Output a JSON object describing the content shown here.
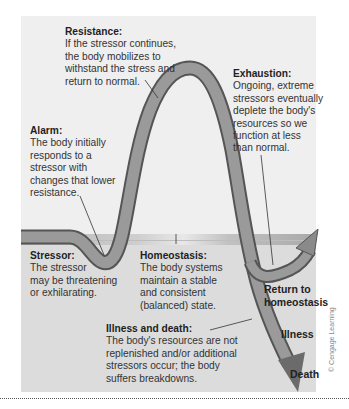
{
  "diagram": {
    "type": "stress-response-curve",
    "colors": {
      "panel_upper": "#efefef",
      "panel_lower": "#dcdcdc",
      "band": "#b5b5b5",
      "curve_fill": "#8f8f8f",
      "curve_edge": "#5a5a5a",
      "text": "#333333"
    },
    "labels": {
      "resistance": {
        "heading": "Resistance:",
        "lines": [
          "If the stressor continues,",
          "the body mobilizes to",
          "withstand the stress and",
          "return to normal."
        ]
      },
      "exhaustion": {
        "heading": "Exhaustion:",
        "lines": [
          "Ongoing, extreme",
          "stressors eventually",
          "deplete the body's",
          "resources so we",
          "function at less",
          "than normal."
        ]
      },
      "alarm": {
        "heading": "Alarm:",
        "lines": [
          "The body initially",
          "responds to a",
          "stressor with",
          "changes that lower",
          "resistance."
        ]
      },
      "stressor": {
        "heading": "Stressor:",
        "lines": [
          "The stressor",
          "may be threatening",
          "or exhilarating."
        ]
      },
      "homeostasis": {
        "heading": "Homeostasis:",
        "lines": [
          "The body systems",
          "maintain a stable",
          "and consistent",
          "(balanced) state."
        ]
      },
      "illness_death": {
        "heading": "Illness and death:",
        "lines": [
          "The body's resources are not",
          "replenished and/or additional",
          "stressors occur; the body",
          "suffers breakdowns."
        ]
      }
    },
    "outcomes": {
      "return": [
        "Return to",
        "homeostasis"
      ],
      "illness": "Illness",
      "death": "Death"
    },
    "credit": "© Cengage Learning"
  }
}
